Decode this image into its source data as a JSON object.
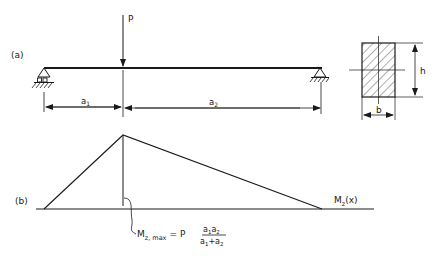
{
  "figure": {
    "panel_a_label": "(a)",
    "panel_b_label": "(b)",
    "load_label": "P",
    "span_a1": {
      "base": "a",
      "sub": "1"
    },
    "span_a2": {
      "base": "a",
      "sub": "2"
    },
    "section_height_label": "h",
    "section_width_label": "b",
    "moment_curve_label": {
      "base": "M",
      "sub": "z",
      "suffix": "(x)"
    },
    "max_moment_formula": {
      "lhs_base": "M",
      "lhs_sub": "z, max",
      "equals": "=",
      "factor": "P",
      "numerator": [
        {
          "base": "a",
          "sub": "1"
        },
        {
          "base": "a",
          "sub": "2"
        }
      ],
      "denominator": [
        {
          "base": "a",
          "sub": "1"
        },
        {
          "op": "+"
        },
        {
          "base": "a",
          "sub": "2"
        }
      ]
    }
  },
  "colors": {
    "ink": "#1a1a1a",
    "background": "#ffffff"
  }
}
